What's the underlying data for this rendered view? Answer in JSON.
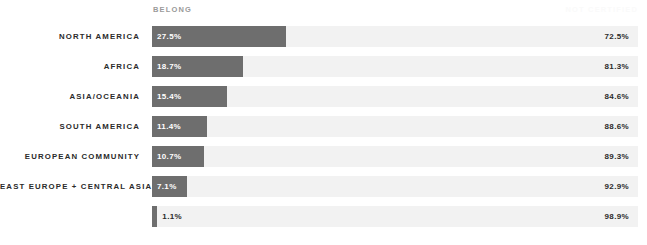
{
  "header": {
    "left_label": "BELONG",
    "right_label": "NOT CERTIFIED"
  },
  "colors": {
    "fill": "#6e6e6e",
    "track": "#f2f2f2",
    "label": "#2b2b2b",
    "header_left": "#9a9a9a",
    "header_right": "#fafafa"
  },
  "chart_data": {
    "type": "bar",
    "title": "",
    "subtitle": "",
    "orientation": "horizontal",
    "stacked": true,
    "xlabel": "",
    "ylabel": "",
    "xlim": [
      0,
      100
    ],
    "grid": false,
    "legend_position": "top",
    "categories": [
      "NORTH AMERICA",
      "AFRICA",
      "ASIA/OCEANIA",
      "SOUTH AMERICA",
      "EUROPEAN COMMUNITY",
      "EAST EUROPE + CENTRAL ASIA",
      ""
    ],
    "series": [
      {
        "name": "BELONG",
        "values": [
          27.5,
          18.7,
          15.4,
          11.4,
          10.7,
          7.1,
          1.1
        ],
        "labels": [
          "27.5%",
          "18.7%",
          "15.4%",
          "11.4%",
          "10.7%",
          "7.1%",
          "1.1%"
        ],
        "color": "#6e6e6e"
      },
      {
        "name": "NOT CERTIFIED",
        "values": [
          72.5,
          81.3,
          84.6,
          88.6,
          89.3,
          92.9,
          98.9
        ],
        "labels": [
          "72.5%",
          "81.3%",
          "84.6%",
          "88.6%",
          "89.3%",
          "92.9%",
          "98.9%"
        ],
        "color": "#f2f2f2"
      }
    ],
    "rows": [
      {
        "label": "NORTH AMERICA",
        "left_value": 27.5,
        "left_label": "27.5%",
        "right_value": 72.5,
        "right_label": "72.5%",
        "label_inside": true
      },
      {
        "label": "AFRICA",
        "left_value": 18.7,
        "left_label": "18.7%",
        "right_value": 81.3,
        "right_label": "81.3%",
        "label_inside": true
      },
      {
        "label": "ASIA/OCEANIA",
        "left_value": 15.4,
        "left_label": "15.4%",
        "right_value": 84.6,
        "right_label": "84.6%",
        "label_inside": true
      },
      {
        "label": "SOUTH AMERICA",
        "left_value": 11.4,
        "left_label": "11.4%",
        "right_value": 88.6,
        "right_label": "88.6%",
        "label_inside": true
      },
      {
        "label": "EUROPEAN COMMUNITY",
        "left_value": 10.7,
        "left_label": "10.7%",
        "right_value": 89.3,
        "right_label": "89.3%",
        "label_inside": true
      },
      {
        "label": "EAST EUROPE + CENTRAL ASIA",
        "left_value": 7.1,
        "left_label": "7.1%",
        "right_value": 92.9,
        "right_label": "92.9%",
        "label_inside": true
      },
      {
        "label": "",
        "left_value": 1.1,
        "left_label": "1.1%",
        "right_value": 98.9,
        "right_label": "98.9%",
        "label_inside": false
      }
    ]
  }
}
